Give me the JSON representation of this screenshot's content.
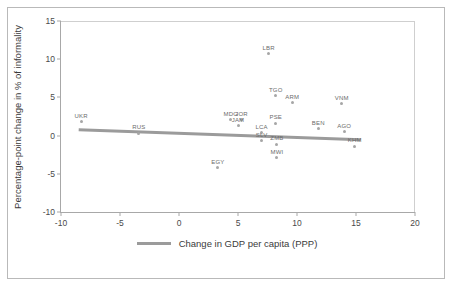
{
  "chart_data": {
    "type": "scatter",
    "title": "",
    "xlabel": "",
    "ylabel": "Percentage-point change in % of informality",
    "xlim": [
      -10,
      20
    ],
    "ylim": [
      -10,
      15
    ],
    "xticks": [
      -10,
      -5,
      0,
      5,
      10,
      15,
      20
    ],
    "xtick_labels": [
      "-10",
      "-5",
      "0",
      "5",
      "10",
      "15",
      "20"
    ],
    "yticks": [
      -10,
      -5,
      0,
      5,
      10,
      15
    ],
    "ytick_labels": [
      "-10",
      "-5",
      "0",
      "5",
      "10",
      "15"
    ],
    "grid": false,
    "legend_position": "bottom-center",
    "point_color": "#a6a6a6",
    "trend_color": "#9b9b9b",
    "points": [
      {
        "label": "UKR",
        "x": -8.3,
        "y": 1.8
      },
      {
        "label": "RUS",
        "x": -3.4,
        "y": 0.3
      },
      {
        "label": "EGY",
        "x": 3.3,
        "y": -4.2
      },
      {
        "label": "MDG",
        "x": 4.4,
        "y": 2.1
      },
      {
        "label": "JOR",
        "x": 5.3,
        "y": 2.1
      },
      {
        "label": "JAM",
        "x": 5.0,
        "y": 1.3
      },
      {
        "label": "LBR",
        "x": 7.6,
        "y": 10.7
      },
      {
        "label": "TGO",
        "x": 8.2,
        "y": 5.2
      },
      {
        "label": "ARM",
        "x": 9.6,
        "y": 4.3
      },
      {
        "label": "PSE",
        "x": 8.2,
        "y": 1.6
      },
      {
        "label": "LCA",
        "x": 7.0,
        "y": 0.4
      },
      {
        "label": "SLV",
        "x": 7.0,
        "y": -0.7
      },
      {
        "label": "ZMB",
        "x": 8.3,
        "y": -1.1
      },
      {
        "label": "MWI",
        "x": 8.3,
        "y": -2.9
      },
      {
        "label": "VNM",
        "x": 13.8,
        "y": 4.2
      },
      {
        "label": "BEN",
        "x": 11.8,
        "y": 0.9
      },
      {
        "label": "AGO",
        "x": 14.0,
        "y": 0.5
      },
      {
        "label": "KHM",
        "x": 14.9,
        "y": -1.4
      }
    ],
    "trend_line": {
      "name": "Change in GDP per capita (PPP)",
      "x0": -8.5,
      "y0": 0.75,
      "x1": 15.4,
      "y1": -0.55
    },
    "legend": [
      {
        "label": "Change in GDP per capita (PPP)",
        "color": "#9b9b9b",
        "marker": "line"
      }
    ]
  }
}
